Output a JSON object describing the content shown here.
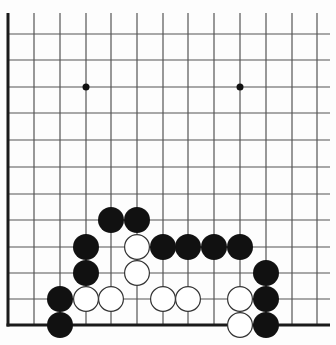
{
  "board": {
    "type": "go-board-partial",
    "view": "lower-left corner region",
    "colors": {
      "background": "#fdfdfd",
      "grid_line": "#555555",
      "edge_line": "#1a1a1a",
      "black_stone": "#111111",
      "white_stone": "#ffffff",
      "white_stone_outline": "#333333",
      "star_point": "#111111"
    },
    "grid": {
      "columns_x": [
        8,
        34,
        60,
        86,
        111,
        137,
        163,
        188,
        214,
        240,
        266,
        292,
        317
      ],
      "rows_y": [
        34,
        60,
        87,
        113,
        140,
        167,
        194,
        220,
        247,
        273,
        299,
        325
      ],
      "line_extend_right": 330,
      "line_top": 13,
      "left_edge_x": 8,
      "bottom_edge_y": 325
    },
    "star_points": [
      {
        "x": 86,
        "y": 87
      },
      {
        "x": 240,
        "y": 87
      }
    ],
    "stone_radius": 13,
    "stones": [
      {
        "color": "black",
        "x": 111,
        "y": 220
      },
      {
        "color": "black",
        "x": 137,
        "y": 220
      },
      {
        "color": "black",
        "x": 86,
        "y": 247
      },
      {
        "color": "white",
        "x": 137,
        "y": 247
      },
      {
        "color": "black",
        "x": 163,
        "y": 247
      },
      {
        "color": "black",
        "x": 188,
        "y": 247
      },
      {
        "color": "black",
        "x": 214,
        "y": 247
      },
      {
        "color": "black",
        "x": 240,
        "y": 247
      },
      {
        "color": "black",
        "x": 86,
        "y": 273
      },
      {
        "color": "white",
        "x": 137,
        "y": 273
      },
      {
        "color": "black",
        "x": 266,
        "y": 273
      },
      {
        "color": "black",
        "x": 60,
        "y": 299
      },
      {
        "color": "white",
        "x": 86,
        "y": 299
      },
      {
        "color": "white",
        "x": 111,
        "y": 299
      },
      {
        "color": "white",
        "x": 163,
        "y": 299
      },
      {
        "color": "white",
        "x": 188,
        "y": 299
      },
      {
        "color": "white",
        "x": 240,
        "y": 299
      },
      {
        "color": "black",
        "x": 266,
        "y": 299
      },
      {
        "color": "black",
        "x": 60,
        "y": 325
      },
      {
        "color": "white",
        "x": 240,
        "y": 325
      },
      {
        "color": "black",
        "x": 266,
        "y": 325
      }
    ]
  }
}
